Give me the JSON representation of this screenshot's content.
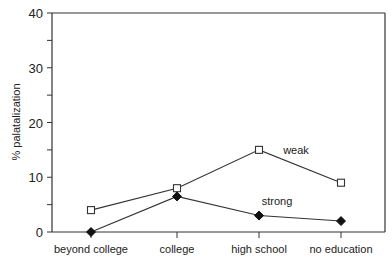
{
  "chart_data": {
    "type": "line",
    "title": "",
    "xlabel": "",
    "ylabel": "% palatalization",
    "ylim": [
      0,
      40
    ],
    "yticks": [
      0,
      10,
      20,
      30,
      40
    ],
    "grid": false,
    "legend_position": "inline labels",
    "categories": [
      "beyond college",
      "college",
      "high school",
      "no education"
    ],
    "series": [
      {
        "name": "weak",
        "marker": "open-square",
        "values": [
          4,
          8,
          15,
          9
        ]
      },
      {
        "name": "strong",
        "marker": "filled-diamond",
        "values": [
          0,
          6.5,
          3,
          2
        ]
      }
    ],
    "annotations": [
      {
        "text": "weak",
        "near": "between high school and no education, above weak line"
      },
      {
        "text": "strong",
        "near": "between high school and no education, above strong line"
      }
    ]
  },
  "labels": {
    "ylabel": "% palatalization",
    "weak": "weak",
    "strong": "strong"
  }
}
